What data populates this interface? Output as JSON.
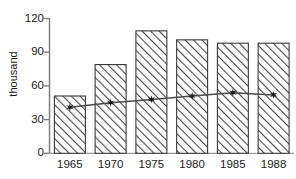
{
  "chart_data": {
    "type": "bar",
    "title": "",
    "subtitle": "",
    "xlabel": "",
    "ylabel": "thousand",
    "categories": [
      "1965",
      "1970",
      "1975",
      "1980",
      "1985",
      "1988"
    ],
    "ylim": [
      0,
      120
    ],
    "yticks": [
      0,
      30,
      60,
      90,
      120
    ],
    "ytick_labels": [
      "0",
      "30",
      "60",
      "90",
      "120"
    ],
    "grid": false,
    "legend": null,
    "series": [
      {
        "name": "bars",
        "type": "bar",
        "values": [
          51,
          79,
          109,
          101,
          98,
          98
        ],
        "fill": "hatch-diagonal",
        "color": "#3a3a3a"
      },
      {
        "name": "line",
        "type": "line",
        "values": [
          41,
          45,
          48,
          51,
          54,
          52
        ],
        "marker": "star",
        "color": "#4a4a4a"
      }
    ]
  },
  "axes": {
    "y_axis_title": "thousand",
    "y_tick_labels": [
      "120",
      "90",
      "60",
      "30",
      "0"
    ],
    "x_tick_labels": [
      "1965",
      "1970",
      "1975",
      "1980",
      "1985",
      "1988"
    ]
  },
  "colors": {
    "axis": "#6b6b6b",
    "bar_edge": "#3a3a3a",
    "bar_hatch": "#555555",
    "line": "#4a4a4a",
    "marker": "#1a1a1a",
    "text": "#1a1a1a",
    "background": "#ffffff"
  }
}
